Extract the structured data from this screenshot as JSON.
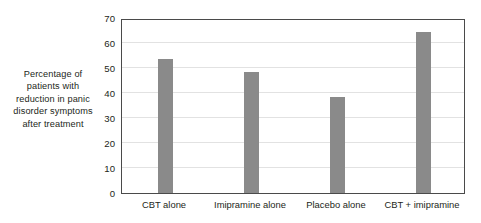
{
  "chart_data": {
    "type": "bar",
    "title": "",
    "xlabel": "",
    "ylabel": "Percentage of patients with reduction in panic disorder symptoms after treatment",
    "ylabel_lines": [
      "Percentage of",
      "patients with",
      "reduction in panic",
      "disorder symptoms",
      "after treatment"
    ],
    "categories": [
      "CBT alone",
      "Imipramine alone",
      "Placebo alone",
      "CBT + imipramine"
    ],
    "values": [
      53.5,
      48.5,
      38.5,
      64.5
    ],
    "ylim": [
      0,
      70
    ],
    "ytick_values": [
      0,
      10,
      20,
      30,
      40,
      50,
      60,
      70
    ],
    "ytick_labels": [
      "0",
      "10",
      "20",
      "30",
      "40",
      "50",
      "60",
      "70"
    ],
    "grid": true,
    "legend": false,
    "bar_color": "#8a8a8a",
    "axis_color": "#4a4a4a",
    "gridline_color": "#e2e2e2",
    "background_color": "#ffffff"
  }
}
